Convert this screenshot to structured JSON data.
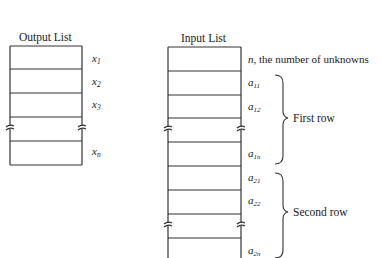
{
  "output_list": {
    "title": "Output List",
    "labels": [
      {
        "base": "x",
        "sub": "1"
      },
      {
        "base": "x",
        "sub": "2"
      },
      {
        "base": "x",
        "sub": "3"
      },
      {
        "base": "x",
        "sub": "n"
      }
    ]
  },
  "input_list": {
    "title": "Input List",
    "first_cell_label_var": "n",
    "first_cell_label_text": ", the number of unknowns",
    "labels": [
      {
        "base": "a",
        "sub": "11"
      },
      {
        "base": "a",
        "sub": "12"
      },
      {
        "base": "a",
        "sub": "1n"
      },
      {
        "base": "a",
        "sub": "21"
      },
      {
        "base": "a",
        "sub": "22"
      },
      {
        "base": "a",
        "sub": "2n"
      }
    ],
    "groups": [
      {
        "label": "First row"
      },
      {
        "label": "Second row"
      }
    ]
  },
  "colors": {
    "line": "#333333",
    "background": "#ffffff"
  }
}
